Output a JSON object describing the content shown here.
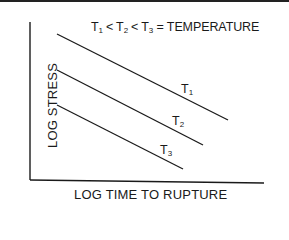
{
  "diagram": {
    "title": {
      "parts": [
        "T",
        "1",
        "<",
        "T",
        "2",
        "<",
        "T",
        "3",
        "= TEMPERATURE"
      ],
      "text": "T1 < T2 < T3 = TEMPERATURE"
    },
    "y_axis_label": "LOG STRESS",
    "x_axis_label": "LOG TIME TO RUPTURE",
    "curves": [
      {
        "name": "T",
        "sub": "1",
        "x1": 57,
        "y1": 34,
        "x2": 228,
        "y2": 120
      },
      {
        "name": "T",
        "sub": "2",
        "x1": 57,
        "y1": 70,
        "x2": 203,
        "y2": 145
      },
      {
        "name": "T",
        "sub": "3",
        "x1": 57,
        "y1": 105,
        "x2": 183,
        "y2": 169
      }
    ],
    "colors": {
      "line": "#1a1a1a",
      "background": "#ffffff"
    }
  }
}
